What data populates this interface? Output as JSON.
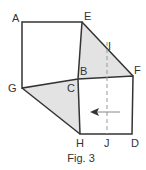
{
  "figure": {
    "caption": "Fig. 3",
    "colors": {
      "stroke": "#333333",
      "shade": "#e3e3e3",
      "dashed": "#999999",
      "arrow": "#333333"
    },
    "points": {
      "A": [
        22,
        22
      ],
      "E": [
        82,
        22
      ],
      "F": [
        133,
        76
      ],
      "B": [
        78,
        79
      ],
      "C": [
        78,
        79
      ],
      "G": [
        22,
        88
      ],
      "H": [
        80,
        134
      ],
      "D": [
        132,
        134
      ],
      "I": [
        107,
        40
      ],
      "J": [
        107,
        134
      ]
    },
    "labels": [
      {
        "text": "A",
        "x": 12,
        "y": 22
      },
      {
        "text": "E",
        "x": 84,
        "y": 20
      },
      {
        "text": "I",
        "x": 108,
        "y": 50
      },
      {
        "text": "B",
        "x": 80,
        "y": 75
      },
      {
        "text": "F",
        "x": 134,
        "y": 74
      },
      {
        "text": "G",
        "x": 8,
        "y": 92
      },
      {
        "text": "C",
        "x": 67,
        "y": 92
      },
      {
        "text": "H",
        "x": 76,
        "y": 147
      },
      {
        "text": "J",
        "x": 104,
        "y": 147
      },
      {
        "text": "D",
        "x": 131,
        "y": 147
      }
    ]
  }
}
